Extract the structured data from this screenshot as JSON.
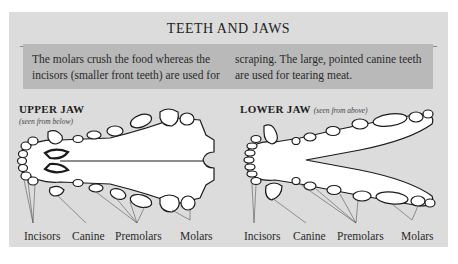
{
  "title": "TEETH AND JAWS",
  "intro": {
    "column1": "The molars crush the food whereas the incisors (smaller front teeth) are used for",
    "column2": "scraping. The large, pointed canine teeth are used for tearing meat."
  },
  "upper_jaw": {
    "heading": "UPPER JAW",
    "subheading": "(seen from below)",
    "labels": [
      "Incisors",
      "Canine",
      "Premolars",
      "Molars"
    ]
  },
  "lower_jaw": {
    "heading": "LOWER JAW",
    "subheading": "(seen from above)",
    "labels": [
      "Incisors",
      "Canine",
      "Premolars",
      "Molars"
    ]
  },
  "colors": {
    "panel": "#dcdcdc",
    "textbox": "#b9b9b9",
    "outline": "#1a1a1a",
    "bone": "#ffffff"
  }
}
